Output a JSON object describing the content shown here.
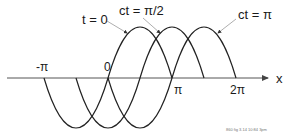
{
  "diagram": {
    "axis": {
      "label": "x",
      "ticks": [
        {
          "label": "-π",
          "value": -3.14159
        },
        {
          "label": "0",
          "value": 0
        },
        {
          "label": "π",
          "value": 3.14159
        },
        {
          "label": "2π",
          "value": 6.28318
        }
      ]
    },
    "curves": [
      {
        "label": "t = 0",
        "shift": 0
      },
      {
        "label": "ct = π/2",
        "shift": 1.5708
      },
      {
        "label": "ct = π",
        "shift": 3.14159
      }
    ],
    "footer": "860 fig 3.14 10:84 3pm",
    "colors": {
      "curve": "#222222",
      "axis": "#555555",
      "pointer": "#999999",
      "text": "#1a1a1a"
    }
  }
}
